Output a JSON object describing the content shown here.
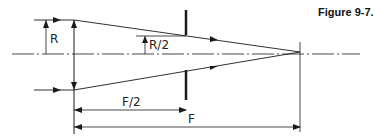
{
  "figure": {
    "caption": "Figure 9-7.",
    "labels": {
      "radius": "R",
      "half_radius": "R/2",
      "half_focal": "F/2",
      "focal": "F"
    },
    "colors": {
      "line": "#1a1a1a",
      "background": "#ffffff"
    }
  }
}
